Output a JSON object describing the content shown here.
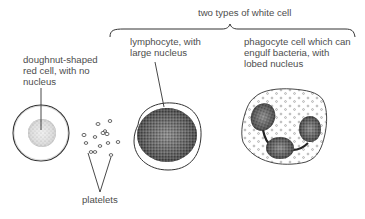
{
  "title": "two types of white cell",
  "labels": {
    "red_cell": [
      "doughnut-shaped",
      "red cell, with no",
      "nucleus"
    ],
    "lymphocyte": [
      "lymphocyte, with",
      "large nucleus"
    ],
    "phagocyte": [
      "phagocyte cell which can",
      "engulf bacteria, with",
      "lobed nucleus"
    ],
    "platelets": "platelets"
  },
  "colors": {
    "line": "#333333",
    "text": "#4d4d4d",
    "nucleus_dark": "#2a2a2a",
    "stipple": "#8a8a8a"
  }
}
